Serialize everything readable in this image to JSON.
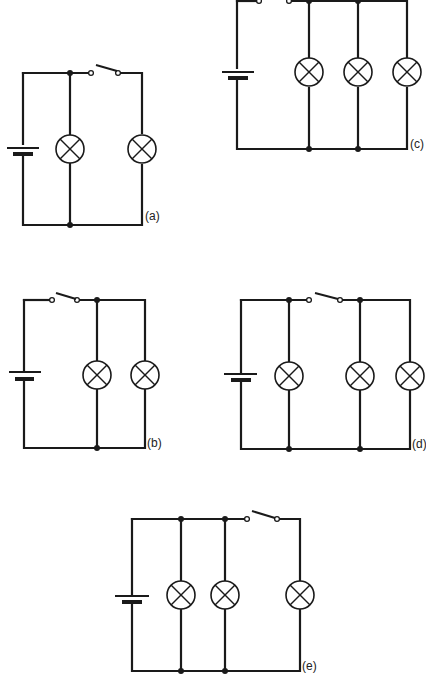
{
  "diagram": {
    "type": "circuit-diagrams",
    "circuits": [
      {
        "id": "a",
        "label": "(a)",
        "description": "Battery with one lamp in parallel branch; switch in series with second lamp branch",
        "lamps": 2,
        "switch_state": "open"
      },
      {
        "id": "b",
        "label": "(b)",
        "description": "Switch between battery and both parallel lamps",
        "lamps": 2,
        "switch_state": "open"
      },
      {
        "id": "c",
        "label": "(c)",
        "description": "Switch between battery and three parallel lamps",
        "lamps": 3,
        "switch_state": "open"
      },
      {
        "id": "d",
        "label": "(d)",
        "description": "One lamp directly across battery; switch controls two further parallel lamps",
        "lamps": 3,
        "switch_state": "open"
      },
      {
        "id": "e",
        "label": "(e)",
        "description": "Two lamps directly across battery; switch controls third lamp",
        "lamps": 3,
        "switch_state": "open"
      }
    ]
  },
  "colors": {
    "ink": "#1a1a1a",
    "background": "#ffffff"
  }
}
